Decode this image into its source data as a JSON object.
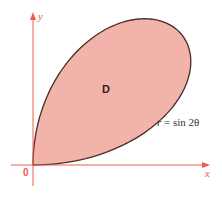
{
  "figure": {
    "region_label": "D",
    "equation": {
      "lhs": "r",
      "eq": "=",
      "rhs": "sin 2θ"
    },
    "axes": {
      "x_label": "x",
      "y_label": "y",
      "origin_label": "0"
    },
    "colors": {
      "axis": "#E8604A",
      "fill": "#F2B3AB",
      "curve": "#4A2A26",
      "label_accent": "#E8604A"
    }
  }
}
